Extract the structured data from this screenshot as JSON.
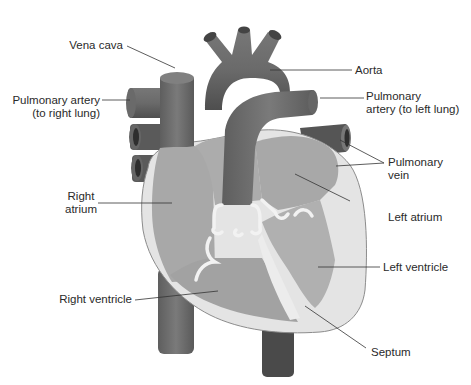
{
  "diagram": {
    "colors": {
      "background": "#ffffff",
      "outer_wall": "#e6e6e6",
      "wall_edge": "#8c8c8c",
      "chamber": "#a6a6a6",
      "chamber_light": "#b3b3b3",
      "vessel": "#707070",
      "vessel_dark": "#555555",
      "valve": "#f0f0f0",
      "label_text": "#2a2a2a",
      "leader_line": "#333333"
    },
    "labels": {
      "vena_cava": "Vena cava",
      "pulm_artery_right_1": "Pulmonary artery",
      "pulm_artery_right_2": "(to right lung)",
      "right_atrium_1": "Right",
      "right_atrium_2": "atrium",
      "right_ventricle": "Right ventricle",
      "aorta": "Aorta",
      "pulm_artery_left_1": "Pulmonary",
      "pulm_artery_left_2": "artery (to left lung)",
      "pulm_vein_1": "Pulmonary",
      "pulm_vein_2": "vein",
      "left_atrium": "Left atrium",
      "left_ventricle": "Left ventricle",
      "septum": "Septum"
    }
  }
}
